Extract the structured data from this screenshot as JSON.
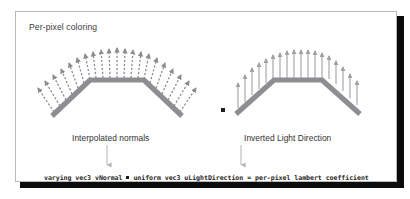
{
  "slide": {
    "title": "Per-pixel coloring",
    "background_color": "#ffffff",
    "frame_border_color": "#b9b9bb",
    "shadow_color": "#0b0b0b"
  },
  "diagrams": {
    "left": {
      "caption": "Interpolated normals",
      "description": "fan of dashed normal vectors radiating from a trapezoidal surface",
      "arrow_color": "#8c8c90",
      "surface_color": "#8e8e92",
      "arrow_count": 21,
      "arrow_style": "dashed"
    },
    "right": {
      "caption": "Inverted Light Direction",
      "description": "parallel vertical light-direction vectors above a trapezoidal surface",
      "arrow_color": "#a0a0a4",
      "surface_color": "#8e8e92",
      "arrow_count": 17,
      "arrow_style": "solid"
    },
    "operator": {
      "symbol": "dot-product",
      "color": "#1d1d1f"
    }
  },
  "code": {
    "varying_decl": "varying vec3 vNormal",
    "operator": "·",
    "uniform_decl": "uniform  vec3 uLightDirection",
    "equals": "=",
    "result": "per-pixel lambert coefficient",
    "color": "#1e1e20"
  },
  "connectors": {
    "left_arrow_label": "down-arrow-from-interpolated-normals",
    "right_arrow_label": "down-arrow-from-inverted-light-direction",
    "color": "#b4b4b8"
  }
}
